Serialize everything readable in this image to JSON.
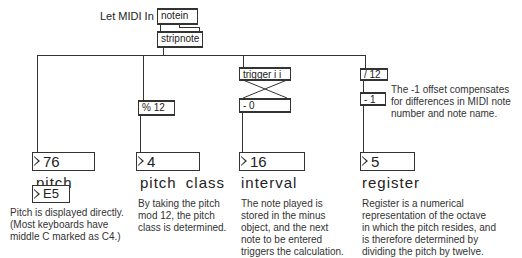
{
  "header": {
    "midi_label": "Let MIDI In"
  },
  "objects": {
    "notein": "notein",
    "stripnote": "stripnote",
    "mod": "% 12",
    "trigger": "trigger i i",
    "minus0": "- 0",
    "div": "/ 12",
    "minus1": "- 1"
  },
  "outputs": {
    "pitch": {
      "value": "76",
      "label": "pitch"
    },
    "pitch_class": {
      "value": "4",
      "label": "pitch class"
    },
    "interval": {
      "value": "16",
      "label": "interval"
    },
    "register": {
      "value": "5",
      "label": "register"
    },
    "note_name": {
      "value": "E5"
    }
  },
  "comments": {
    "offset": "The -1 offset compensates\nfor differences in MIDI note\nnumber and note name.",
    "pitch_class": "By taking the pitch\nmod 12, the pitch\nclass is determined.",
    "interval": "The note played is\nstored in the minus\nobject, and the next\nnote to be entered\ntriggers the calculation.",
    "register": "Register is a numerical\nrepresentation of the octave\nin which the pitch resides, and\nis therefore determined by\ndividing the pitch by twelve.",
    "pitch": "Pitch is displayed directly.\n(Most keyboards have\nmiddle C marked as C4.)"
  }
}
